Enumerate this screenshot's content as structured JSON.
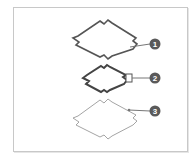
{
  "diagram": {
    "colors": {
      "frame_border": "#c8c8c8",
      "shape1_stroke": "#555555",
      "shape2_stroke": "#444444",
      "shape3_stroke": "#9a9a9a",
      "callout_fill": "#5a5a5a",
      "callout_line": "#777777"
    },
    "callouts": [
      {
        "label": "1",
        "target": "thick-outline-diamond"
      },
      {
        "label": "2",
        "target": "selected-vertex-handle"
      },
      {
        "label": "3",
        "target": "thin-outline-diamond"
      }
    ]
  }
}
